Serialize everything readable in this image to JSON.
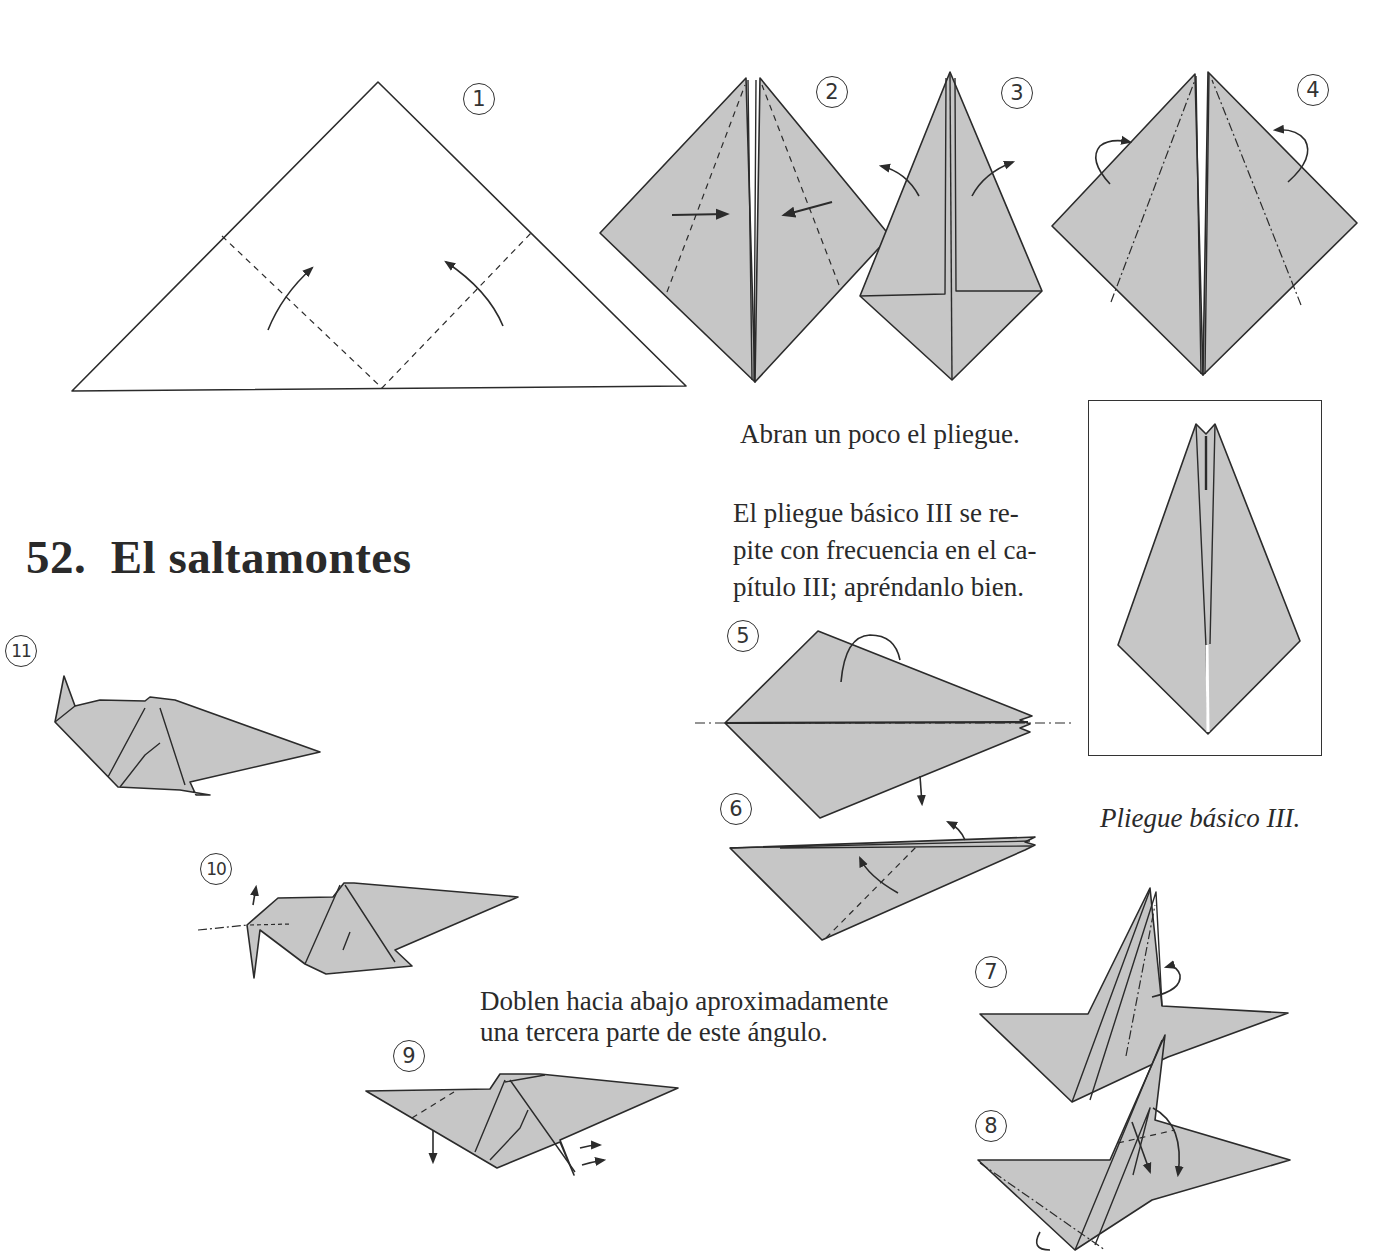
{
  "page": {
    "title": "52.  El saltamontes",
    "captions": {
      "open_fold": "Abran un poco el pliegue.",
      "basic_fold_note": [
        "El pliegue básico III se re-",
        "pite con frecuencia en el ca-",
        "pítulo III; apréndanlo bien."
      ],
      "fold_down": [
        "Doblen hacia abajo aproximadamente",
        "una tercera parte de este ángulo."
      ],
      "basic_fold_label": "Pliegue básico III."
    },
    "steps": [
      {
        "num": "1"
      },
      {
        "num": "2"
      },
      {
        "num": "3"
      },
      {
        "num": "4"
      },
      {
        "num": "5"
      },
      {
        "num": "6"
      },
      {
        "num": "7"
      },
      {
        "num": "8"
      },
      {
        "num": "9"
      },
      {
        "num": "10"
      },
      {
        "num": "11"
      }
    ],
    "colors": {
      "paper_fill": "#c6c6c6",
      "line": "#2b2b2b",
      "background": "#ffffff"
    }
  }
}
